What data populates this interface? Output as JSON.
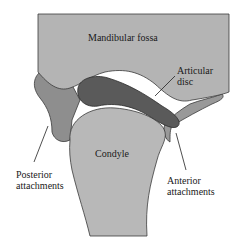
{
  "diagram": {
    "type": "anatomical-cross-section",
    "labels": {
      "mandibular_fossa": "Mandibular fossa",
      "articular_disc_line1": "Articular",
      "articular_disc_line2": "disc",
      "condyle": "Condyle",
      "posterior_line1": "Posterior",
      "posterior_line2": "attachments",
      "anterior_line1": "Anterior",
      "anterior_line2": "attachments"
    },
    "colors": {
      "fossa": "#b4b4b4",
      "condyle": "#b8b8b8",
      "disc": "#5a5a5a",
      "attachments": "#8e8e8e",
      "outline": "#3a3a3a",
      "background": "#ffffff"
    }
  }
}
